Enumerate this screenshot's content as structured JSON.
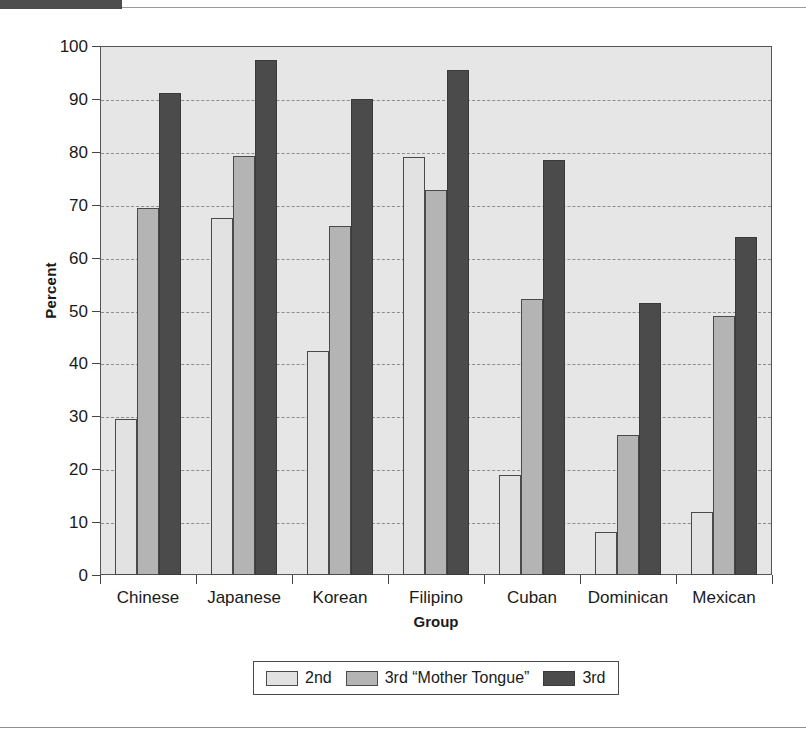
{
  "chart_data": {
    "type": "bar",
    "title": "",
    "xlabel": "Group",
    "ylabel": "Percent",
    "ylim": [
      0,
      100
    ],
    "ytick_step": 10,
    "yticks": [
      0,
      10,
      20,
      30,
      40,
      50,
      60,
      70,
      80,
      90,
      100
    ],
    "grid": true,
    "legend_position": "bottom",
    "categories": [
      "Chinese",
      "Japanese",
      "Korean",
      "Filipino",
      "Cuban",
      "Dominican",
      "Mexican"
    ],
    "series": [
      {
        "name": "2nd",
        "color": "#e2e2e2",
        "values": [
          29.4,
          67.4,
          42.4,
          79.0,
          19.0,
          8.1,
          12.0
        ]
      },
      {
        "name": "3rd “Mother Tongue”",
        "color": "#b4b4b4",
        "values": [
          69.3,
          79.3,
          66.0,
          72.8,
          52.1,
          26.4,
          48.9
        ]
      },
      {
        "name": "3rd",
        "color": "#4b4b4b",
        "values": [
          91.1,
          97.4,
          90.0,
          95.5,
          78.4,
          51.4,
          63.9
        ]
      }
    ]
  },
  "axes": {
    "ylabel": "Percent",
    "xlabel": "Group"
  },
  "legend": {
    "items": [
      {
        "label": "2nd"
      },
      {
        "label": "3rd “Mother Tongue”"
      },
      {
        "label": "3rd"
      }
    ]
  },
  "colors": {
    "series_2nd": "#e2e2e2",
    "series_3rd_mother_tongue": "#b4b4b4",
    "series_3rd": "#4b4b4b",
    "plot_background": "#e6e6e6",
    "axis": "#555555",
    "gridline": "#8d8d8d",
    "page_background": "#ffffff"
  }
}
